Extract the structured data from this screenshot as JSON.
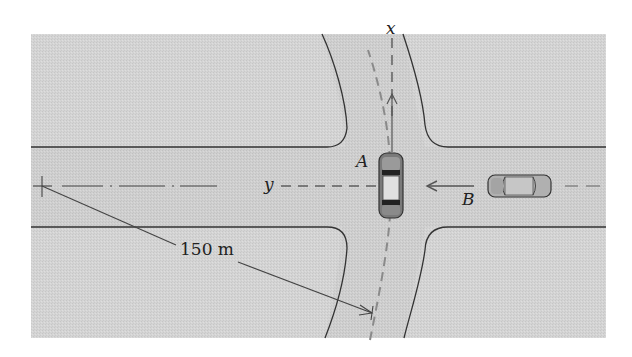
{
  "figure": {
    "type": "intersection-diagram",
    "background_color": "#ffffff",
    "ground_color": "#d6d6d6",
    "road_color": "#cdcdcd",
    "line_color": "#333333",
    "path_color": "#8a8a8a"
  },
  "labels": {
    "x_axis": "x",
    "y_axis": "y",
    "car_a": "A",
    "car_b": "B",
    "radius": "150 m"
  },
  "cars": [
    {
      "id": "A",
      "orientation": "north",
      "description": "car A in intersection heading up along x"
    },
    {
      "id": "B",
      "orientation": "west",
      "description": "car B approaching from right heading left"
    }
  ],
  "annotations": {
    "radius_value": 150,
    "radius_unit": "m"
  }
}
